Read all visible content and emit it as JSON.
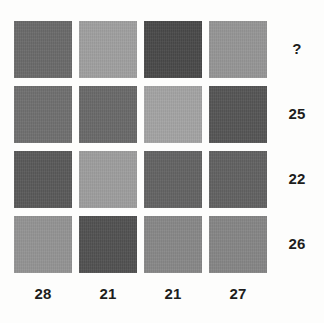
{
  "chart_data": {
    "type": "heatmap",
    "title": "",
    "xlabel": "",
    "ylabel": "",
    "grid": false,
    "legend": "none",
    "rows": 4,
    "cols": 4,
    "cells": [
      [
        {
          "gray": 107,
          "hex": "#6b6b6b"
        },
        {
          "gray": 160,
          "hex": "#a0a0a0"
        },
        {
          "gray": 74,
          "hex": "#4a4a4a"
        },
        {
          "gray": 150,
          "hex": "#969696"
        }
      ],
      [
        {
          "gray": 112,
          "hex": "#707070"
        },
        {
          "gray": 106,
          "hex": "#6a6a6a"
        },
        {
          "gray": 164,
          "hex": "#a4a4a4"
        },
        {
          "gray": 86,
          "hex": "#565656"
        }
      ],
      [
        {
          "gray": 90,
          "hex": "#5a5a5a"
        },
        {
          "gray": 158,
          "hex": "#9e9e9e"
        },
        {
          "gray": 100,
          "hex": "#646464"
        },
        {
          "gray": 98,
          "hex": "#626262"
        }
      ],
      [
        {
          "gray": 148,
          "hex": "#949494"
        },
        {
          "gray": 82,
          "hex": "#525252"
        },
        {
          "gray": 136,
          "hex": "#888888"
        },
        {
          "gray": 134,
          "hex": "#868686"
        }
      ]
    ],
    "row_totals": [
      "?",
      "25",
      "22",
      "26"
    ],
    "col_totals": [
      "28",
      "21",
      "21",
      "27"
    ],
    "unknown_marker": "?",
    "background": "#fdfdfc",
    "label_color": "#1d1d1d"
  }
}
